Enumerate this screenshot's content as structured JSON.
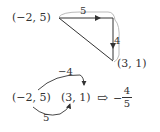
{
  "top_diagram": {
    "start_point": "(−2, 5)",
    "end_point": "(3, 1)",
    "horizontal_label": "5",
    "vertical_label": "4"
  },
  "bottom_diagram": {
    "point_a": "(−2, 5)",
    "point_b": "(3, 1)",
    "upper_arc_label": "−4",
    "lower_arc_label": "5",
    "arrow_glyph": "⇨",
    "result_sign": "−",
    "result_numerator": "4",
    "result_denominator": "5"
  },
  "colors": {
    "stroke": "#333333",
    "bracket": "#999999"
  }
}
